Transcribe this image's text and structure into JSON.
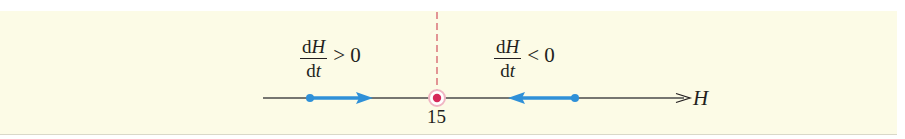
{
  "figure": {
    "background_color": "#fcfbe6",
    "axis": {
      "variable": "H",
      "line_color": "#4a4a4a"
    },
    "equilibrium": {
      "value_label": "15",
      "dot_color": "#d6285a",
      "ring_color": "#f0b5c3",
      "dashed_line_color": "#d86a72"
    },
    "flow_arrow_color": "#2f90d8",
    "regions": [
      {
        "side": "left",
        "numerator_d": "d",
        "numerator_var": "H",
        "denominator_d": "d",
        "denominator_var": "t",
        "relation": "> 0",
        "direction": "right"
      },
      {
        "side": "right",
        "numerator_d": "d",
        "numerator_var": "H",
        "denominator_d": "d",
        "denominator_var": "t",
        "relation": "< 0",
        "direction": "left"
      }
    ]
  }
}
